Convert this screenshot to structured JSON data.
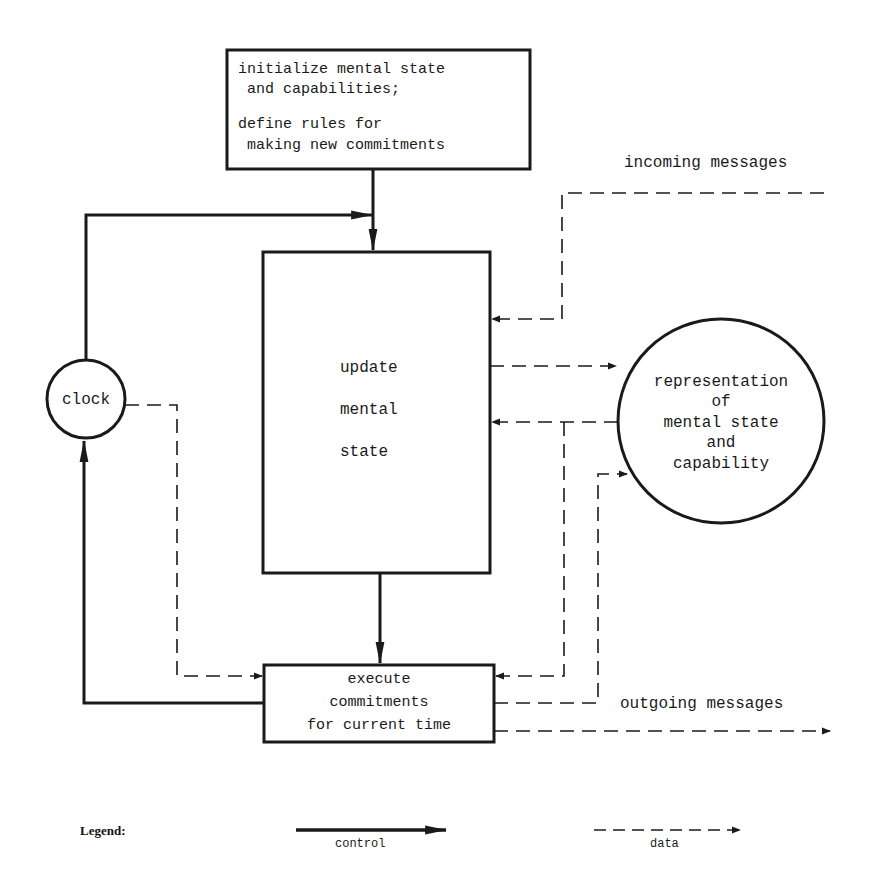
{
  "diagram": {
    "init_box": {
      "lines": [
        "initialize mental state",
        " and capabilities;",
        "define rules for",
        " making new commitments"
      ]
    },
    "update_box": {
      "lines": [
        "update",
        "mental",
        "state"
      ]
    },
    "execute_box": {
      "lines": [
        "execute",
        "commitments",
        "for current time"
      ]
    },
    "clock": {
      "label": "clock"
    },
    "representation": {
      "lines": [
        "representation",
        "of",
        "mental state",
        "and",
        "capability"
      ]
    },
    "incoming_label": "incoming messages",
    "outgoing_label": "outgoing messages"
  },
  "legend": {
    "title": "Legend:",
    "control_label": "control",
    "data_label": "data"
  },
  "colors": {
    "ink": "#1a1a1a",
    "background": "#ffffff",
    "faint_text": "#e4e4e4"
  }
}
